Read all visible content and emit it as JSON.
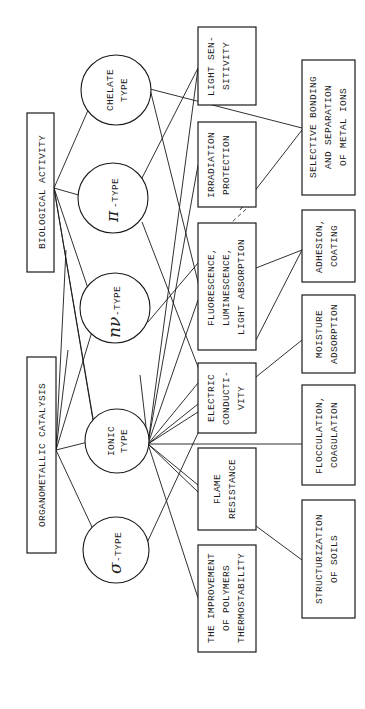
{
  "diagram": {
    "orientation": "rotated 90 degrees counter-clockwise (text reads bottom-to-top)",
    "left_boxes": [
      {
        "id": "biological-activity",
        "label": "BIOLOGICAL ACTIVITY"
      },
      {
        "id": "organometallic-catalysis",
        "label": "ORGANOMETALLIC CATALYSIS"
      }
    ],
    "circles": [
      {
        "id": "chelate",
        "line1": "CHELATE",
        "line2": "TYPE"
      },
      {
        "id": "pi",
        "symbol": "π",
        "label": "-TYPE"
      },
      {
        "id": "n-nu",
        "symbol": "nν",
        "label": "-TYPE"
      },
      {
        "id": "ionic",
        "line1": "IONIC",
        "line2": "TYPE"
      },
      {
        "id": "sigma",
        "symbol": "σ",
        "label": "-TYPE"
      }
    ],
    "middle_boxes": [
      {
        "id": "light-sensitivity",
        "lines": [
          "LIGHT SEN-",
          "SITIVITY"
        ]
      },
      {
        "id": "irradiation-protection",
        "lines": [
          "IRRADIATION",
          "PROTECTION"
        ]
      },
      {
        "id": "fluorescence",
        "lines": [
          "FLUORESCENCE,",
          "LUMINESCENCE,",
          "LIGHT ABSORPTION"
        ]
      },
      {
        "id": "electric-conductivity",
        "lines": [
          "ELECTRIC",
          "CONDUCTI-",
          "VITY"
        ]
      },
      {
        "id": "flame-resistance",
        "lines": [
          "FLAME",
          "RESISTANCE"
        ]
      },
      {
        "id": "thermostability",
        "lines": [
          "THE IMPROVEMENT",
          "OF POLYMERS",
          "THERMOSTABILITY"
        ]
      }
    ],
    "right_boxes": [
      {
        "id": "selective-bonding",
        "lines": [
          "SELECTIVE BONDING",
          "AND SEPARATION",
          "OF METAL IONS"
        ]
      },
      {
        "id": "adhesion-coating",
        "lines": [
          "ADHESION,",
          "COATING"
        ]
      },
      {
        "id": "moisture-adsorption",
        "lines": [
          "MOISTURE",
          "ADSORPTION"
        ]
      },
      {
        "id": "flocculation",
        "lines": [
          "FLOCCULATION,",
          "COAGULATION"
        ]
      },
      {
        "id": "structurization",
        "lines": [
          "STRUCTURIZATION",
          "OF SOILS"
        ]
      }
    ]
  }
}
